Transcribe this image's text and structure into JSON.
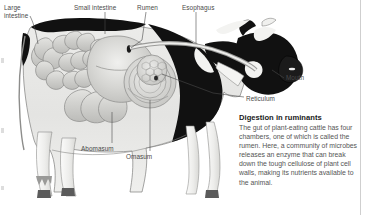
{
  "figure": {
    "kind": "anatomical-illustration",
    "labels": [
      {
        "id": "large-intestine",
        "text": "Large\nintestine",
        "x": 4,
        "y": 4
      },
      {
        "id": "small-intestine",
        "text": "Small intestine",
        "x": 74,
        "y": 4
      },
      {
        "id": "rumen",
        "text": "Rumen",
        "x": 137,
        "y": 4
      },
      {
        "id": "esophagus",
        "text": "Esophagus",
        "x": 182,
        "y": 4
      },
      {
        "id": "mouth",
        "text": "Mouth",
        "x": 286,
        "y": 74
      },
      {
        "id": "reticulum",
        "text": "Reticulum",
        "x": 246,
        "y": 95
      },
      {
        "id": "abomasum",
        "text": "Abomasum",
        "x": 81,
        "y": 145
      },
      {
        "id": "omasum",
        "text": "Omasum",
        "x": 126,
        "y": 153
      }
    ]
  },
  "caption": {
    "title": "Digestion in ruminants",
    "body": "The gut of plant-eating cattle has four chambers, one of which is called the rumen. Here, a community of microbes releases an enzyme that can break down the tough cellulose of plant cell walls, making its nutrients available to the animal."
  },
  "colors": {
    "page_background": "#ffffff",
    "cow_hide_black": "#111111",
    "cow_hide_white": "#f2f2f2",
    "body_ghost_fill": "#e7e7e5",
    "organ_fill": "#cdcdcb",
    "organ_outline": "#8a8a88",
    "hoof": "#5b5b5b",
    "leader_line": "#4a4a4a",
    "label_text": "#4a4a4a",
    "caption_title": "#1a1a1a",
    "caption_body": "#555555",
    "right_rule": "#cfcfcf"
  }
}
